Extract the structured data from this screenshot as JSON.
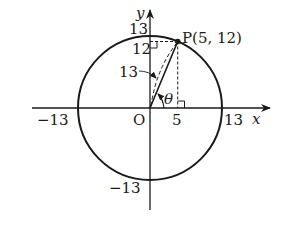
{
  "diagram": {
    "type": "unit-circle-point",
    "axes": {
      "x_label": "x",
      "y_label": "y",
      "origin_label": "O"
    },
    "circle": {
      "radius_value": 13,
      "tick_labels": {
        "x_pos": "13",
        "x_neg": "−13",
        "y_pos": "13",
        "y_neg": "−13"
      }
    },
    "point": {
      "label": "P(5, 12)",
      "x": 5,
      "y": 12
    },
    "annotations": {
      "x_coord_label": "5",
      "y_coord_label": "12",
      "radius_label": "13",
      "angle_label": "θ"
    },
    "colors": {
      "stroke": "#1a1a1a",
      "background": "#ffffff"
    }
  }
}
